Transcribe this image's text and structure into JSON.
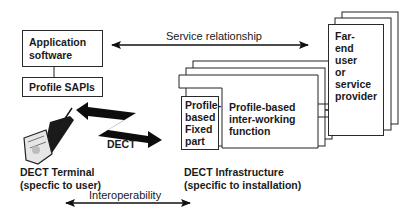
{
  "diagram": {
    "application_software": {
      "line1": "Application",
      "line2": "software"
    },
    "profile_sapis": "Profile SAPIs",
    "service_relationship": "Service relationship",
    "far_end": {
      "line1": "Far-",
      "line2": "end",
      "line3": "user",
      "line4": "or",
      "line5": "service",
      "line6": "provider"
    },
    "fixed_part": {
      "line1": "Profile-",
      "line2": "based",
      "line3": "Fixed",
      "line4": "part"
    },
    "interworking": {
      "line1": "Profile-based",
      "line2": "inter-working",
      "line3": "function"
    },
    "dect_link": "DECT",
    "terminal": {
      "line1": "DECT Terminal",
      "line2": "(specfic to user)"
    },
    "infrastructure": {
      "line1": "DECT Infrastructure",
      "line2": "(specific to installation)"
    },
    "interoperability": "Interoperability",
    "icons": {
      "terminal": "handset-phone-icon",
      "dect_link": "lightning-double-arrow-icon"
    },
    "colors": {
      "line": "#1a1a1a",
      "background": "#ffffff"
    }
  }
}
